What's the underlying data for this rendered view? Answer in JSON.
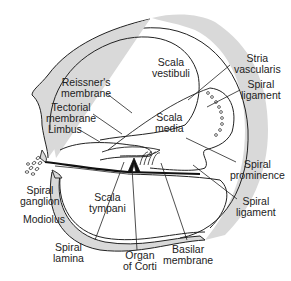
{
  "diagram": {
    "colors": {
      "bone_fill": "#d9d9d9",
      "outline": "#222222",
      "background": "#ffffff"
    },
    "labels": {
      "scala_vestibuli": [
        "Scala",
        "vestibuli"
      ],
      "reissners_membrane": [
        "Reissner's",
        "membrane"
      ],
      "tectorial_membrane": [
        "Tectorial",
        "membrane"
      ],
      "limbus": [
        "Limbus"
      ],
      "scala_media": [
        "Scala",
        "media"
      ],
      "stria_vascularis": [
        "Stria",
        "vascularis"
      ],
      "spiral_ligament_upper": [
        "Spiral",
        "ligament"
      ],
      "spiral_prominence": [
        "Spiral",
        "prominence"
      ],
      "spiral_ligament_lower": [
        "Spiral",
        "ligament"
      ],
      "spiral_ganglion": [
        "Spiral",
        "ganglion"
      ],
      "modiolus": [
        "Modiolus"
      ],
      "scala_tympani": [
        "Scala",
        "tympani"
      ],
      "spiral_lamina": [
        "Spiral",
        "lamina"
      ],
      "organ_of_corti": [
        "Organ",
        "of Corti"
      ],
      "basilar_membrane": [
        "Basilar",
        "membrane"
      ]
    }
  }
}
